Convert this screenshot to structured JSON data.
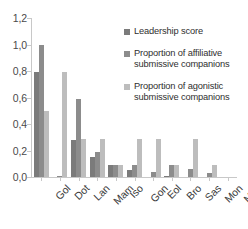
{
  "chart_data": {
    "type": "bar",
    "title": "",
    "xlabel": "",
    "ylabel": "",
    "ylim": [
      0.0,
      1.2
    ],
    "ytick_labels": [
      "0,0",
      "0,2",
      "0,4",
      "0,6",
      "0,8",
      "1,0",
      "1,2"
    ],
    "ytick_values": [
      0.0,
      0.2,
      0.4,
      0.6,
      0.8,
      1.0,
      1.2
    ],
    "grid": false,
    "legend_position": "upper right",
    "categories": [
      "Gol",
      "Dot",
      "Lan",
      "Mam",
      "Iso",
      "Gon",
      "Eol",
      "Bro",
      "Sas",
      "Mon",
      "Mag"
    ],
    "series": [
      {
        "name": "Leadership score",
        "color": "#7b7b7b",
        "values": [
          0.79,
          0.0,
          0.28,
          0.15,
          0.09,
          0.05,
          0.0,
          0.01,
          0.0,
          0.0,
          0.0
        ]
      },
      {
        "name": "Proportion of affiliative submissive companions",
        "color": "#8c8c8c",
        "values": [
          1.0,
          0.01,
          0.59,
          0.19,
          0.09,
          0.09,
          0.04,
          0.09,
          0.06,
          0.03,
          0.0
        ]
      },
      {
        "name": "Proportion of agonistic submissive companions",
        "color": "#bdbdbd",
        "values": [
          0.5,
          0.79,
          0.29,
          0.29,
          0.09,
          0.29,
          0.29,
          0.09,
          0.29,
          0.09,
          0.0
        ]
      }
    ]
  }
}
